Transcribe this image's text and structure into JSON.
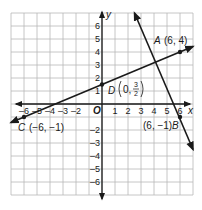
{
  "axes": {
    "x_label": "x",
    "y_label": "y",
    "origin_label": "O",
    "x_range": [
      -7,
      7
    ],
    "y_range": [
      -7,
      7
    ],
    "x_ticks": [
      "-6",
      "-5",
      "-4",
      "-3",
      "-2",
      "1",
      "2",
      "3",
      "4",
      "5",
      "6"
    ],
    "x_tick_values": [
      -6,
      -5,
      -4,
      -3,
      -2,
      1,
      2,
      3,
      4,
      5,
      6
    ],
    "y_ticks": [
      "6",
      "5",
      "4",
      "3",
      "2",
      "1",
      "-2",
      "-3",
      "-4",
      "-5",
      "-6"
    ],
    "y_tick_values": [
      6,
      5,
      4,
      3,
      2,
      1,
      -2,
      -3,
      -4,
      -5,
      -6
    ]
  },
  "points": [
    {
      "name": "A",
      "x": 6,
      "y": 4,
      "coord_text": "(6, 4)"
    },
    {
      "name": "B",
      "x": 6,
      "y": -1,
      "coord_text": "(6, −1)"
    },
    {
      "name": "C",
      "x": -6,
      "y": -1,
      "coord_text": "(−6, −1)"
    },
    {
      "name": "D",
      "x": 0,
      "y": 1.5,
      "coord_text_prefix": "0,",
      "frac_num": "3",
      "frac_den": "2"
    }
  ],
  "lines": [
    {
      "name": "line-CA",
      "through": [
        "C",
        "A"
      ],
      "from": [
        -7,
        -1.42
      ],
      "to": [
        7,
        4.42
      ]
    },
    {
      "name": "line-B-steep",
      "through": [
        "B"
      ],
      "from": [
        2.5,
        7.0
      ],
      "to": [
        7,
        -3.5
      ]
    }
  ],
  "colors": {
    "ink": "#1a1a1a",
    "grid": "#b8b8b8",
    "background": "#ffffff"
  }
}
